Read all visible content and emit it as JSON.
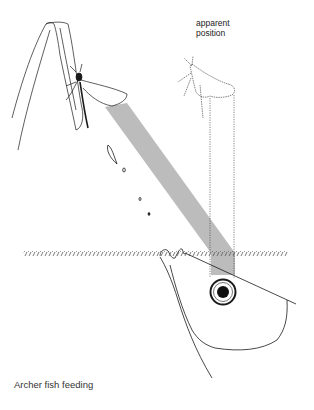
{
  "figure": {
    "caption": "Archer fish feeding",
    "annotations": {
      "apparent_line1": "apparent",
      "apparent_line2": "position"
    },
    "elements": [
      "leaf-stalk",
      "real-insect",
      "water-droplets",
      "light-beam",
      "apparent-insect",
      "sight-lines",
      "water-surface",
      "fish-head",
      "fish-eye"
    ],
    "colors": {
      "ink": "#1a1a1a",
      "beam": "#b5b5b5",
      "background": "#ffffff"
    }
  }
}
